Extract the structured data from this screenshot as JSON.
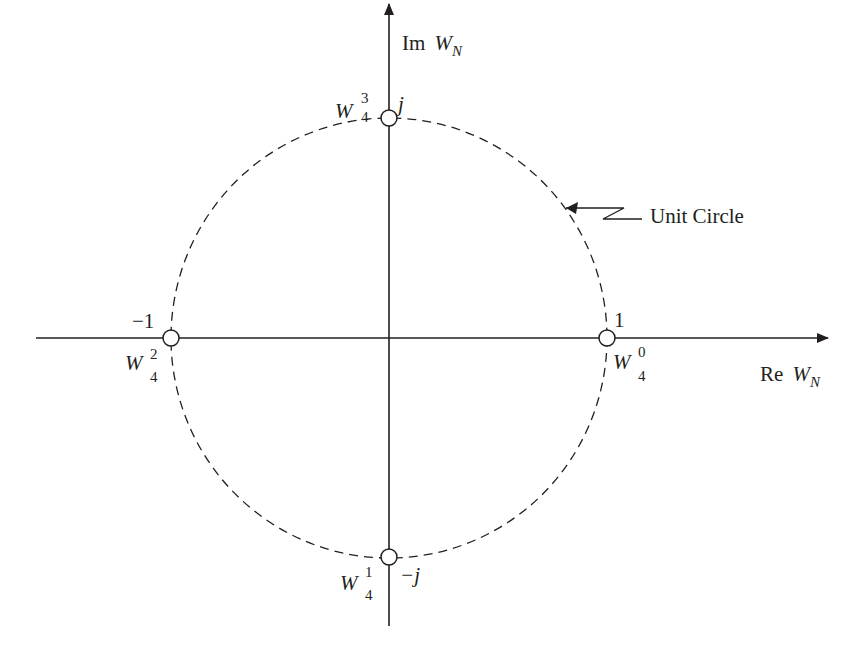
{
  "diagram": {
    "title": "",
    "axes": {
      "real_label_prefix": "Re",
      "real_label_var": "W",
      "real_label_sub": "N",
      "imag_label_prefix": "Im",
      "imag_label_var": "W",
      "imag_label_sub": "N"
    },
    "circle_label": "Unit Circle",
    "points": [
      {
        "id": "w40",
        "value_label": "1",
        "base": "W",
        "sub": "4",
        "sup": "0"
      },
      {
        "id": "w41",
        "value_label": "−j",
        "base": "W",
        "sub": "4",
        "sup": "1"
      },
      {
        "id": "w42",
        "value_label": "−1",
        "base": "W",
        "sub": "4",
        "sup": "2"
      },
      {
        "id": "w43",
        "value_label": "j",
        "base": "W",
        "sub": "4",
        "sup": "3"
      }
    ],
    "colors": {
      "ink": "#231f20",
      "background": "#ffffff"
    }
  }
}
